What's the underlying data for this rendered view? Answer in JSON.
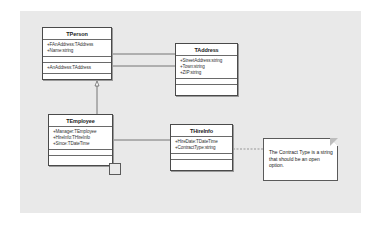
{
  "diagram": {
    "type": "UML class diagram",
    "classes": [
      {
        "name": "TPerson",
        "attributes": [
          "+FAnAddress:TAddress",
          "+Name:string"
        ],
        "sections": [
          "+AnAddress:TAddress"
        ]
      },
      {
        "name": "TAddress",
        "attributes": [
          "+StreetAddress:string",
          "+Town:string",
          "+ZIP:string"
        ],
        "sections": []
      },
      {
        "name": "TEmployee",
        "attributes": [
          "+Manager:TEmployee",
          "+HireInfo:THireInfo",
          "+Since:TDateTime"
        ],
        "sections": []
      },
      {
        "name": "THireInfo",
        "attributes": [
          "+HireDate:TDateTime",
          "+ContractType:string"
        ],
        "sections": []
      }
    ],
    "note": {
      "text": "The Contract Type is a string that should be  an open option."
    },
    "relations": [
      {
        "from": "TPerson",
        "to": "TAddress",
        "kind": "association"
      },
      {
        "from": "TPerson",
        "to": "TAddress",
        "kind": "association"
      },
      {
        "from": "TEmployee",
        "to": "TPerson",
        "kind": "generalization"
      },
      {
        "from": "TEmployee",
        "to": "THireInfo",
        "kind": "association"
      },
      {
        "from": "TEmployee",
        "to": "TEmployee",
        "kind": "self-association"
      },
      {
        "from": "THireInfo",
        "to": "note",
        "kind": "note-link"
      }
    ],
    "colors": {
      "canvas": "#e9e9e9",
      "grid_dot": "#c4c4c4",
      "box_border": "#4a4a4a",
      "box_fill": "#ffffff"
    }
  }
}
